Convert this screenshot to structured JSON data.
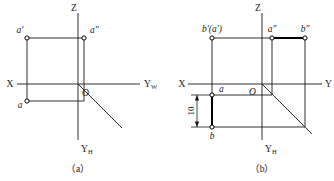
{
  "figure": {
    "background_color": "#ffffff",
    "line_color": "#1a1a1a",
    "bold_line_color": "#000000"
  },
  "panel_a": {
    "caption": "（a）",
    "axis_labels": {
      "z": "Z",
      "x": "X",
      "y_w": "Y",
      "y_w_sub": "W",
      "y_h": "Y",
      "y_h_sub": "H",
      "origin": "O"
    },
    "points": [
      {
        "id": "a-prime",
        "label": "a′",
        "position": "upper-left"
      },
      {
        "id": "a-double-prime",
        "label": "a″",
        "position": "upper-right"
      },
      {
        "id": "a-plain",
        "label": "a",
        "position": "lower-left"
      }
    ]
  },
  "panel_b": {
    "caption": "（b）",
    "axis_labels": {
      "z": "Z",
      "x": "X",
      "y": "Y",
      "y_h": "Y",
      "y_h_sub": "H",
      "origin": "O"
    },
    "dimension": {
      "value": "10"
    },
    "points": [
      {
        "id": "b-prime-a-prime",
        "label": "b′(a′)",
        "position": "upper-left"
      },
      {
        "id": "a-double-prime",
        "label": "a″",
        "position": "upper-middle"
      },
      {
        "id": "b-double-prime",
        "label": "b″",
        "position": "upper-right"
      },
      {
        "id": "a-plain",
        "label": "a",
        "position": "middle-left"
      },
      {
        "id": "b-plain",
        "label": "b",
        "position": "lower-left"
      }
    ]
  }
}
